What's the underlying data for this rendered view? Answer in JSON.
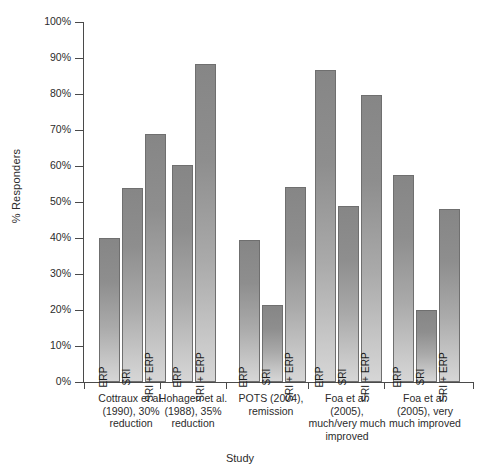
{
  "chart_data": {
    "type": "bar",
    "title": "",
    "xlabel": "Study",
    "ylabel": "% Responders",
    "ylim": [
      0,
      100
    ],
    "ytick_labels": [
      "100%",
      "90%",
      "80%",
      "70%",
      "60%",
      "50%",
      "40%",
      "30%",
      "20%",
      "10%",
      "0%"
    ],
    "ytick_values": [
      100,
      90,
      80,
      70,
      60,
      50,
      40,
      30,
      20,
      10,
      0
    ],
    "grid": false,
    "legend": "none",
    "series_names": [
      "ERP",
      "SRI",
      "SRI + ERP"
    ],
    "categories": [
      "Cottraux et al. (1990), 30% reduction",
      "Hohagen et al. (1988), 35% reduction",
      "POTS (2004), remission",
      "Foa et al. (2005), much/very much improved",
      "Foa et al. (2005), very much improved"
    ],
    "groups": [
      {
        "caption_lines": [
          "Cottraux et al.",
          "(1990), 30%",
          "reduction"
        ],
        "bars": [
          {
            "label": "ERP",
            "value": 40.0
          },
          {
            "label": "SRI",
            "value": 54.0
          },
          {
            "label": "SRI + ERP",
            "value": 69.0
          }
        ]
      },
      {
        "caption_lines": [
          "Hohagen et al.",
          "(1988), 35%",
          "reduction"
        ],
        "bars": [
          {
            "label": "ERP",
            "value": 60.3
          },
          {
            "label": "SRI + ERP",
            "value": 88.2
          }
        ]
      },
      {
        "caption_lines": [
          "POTS (2004),",
          "remission"
        ],
        "bars": [
          {
            "label": "ERP",
            "value": 39.5
          },
          {
            "label": "SRI",
            "value": 21.5
          },
          {
            "label": "SRI + ERP",
            "value": 54.2
          }
        ]
      },
      {
        "caption_lines": [
          "Foa et al.",
          "(2005),",
          "much/very much",
          "improved"
        ],
        "bars": [
          {
            "label": "ERP",
            "value": 86.6
          },
          {
            "label": "SRI",
            "value": 48.9
          },
          {
            "label": "SRI + ERP",
            "value": 79.7
          }
        ]
      },
      {
        "caption_lines": [
          "Foa et al.",
          "(2005), very",
          "much improved"
        ],
        "bars": [
          {
            "label": "ERP",
            "value": 57.5
          },
          {
            "label": "SRI",
            "value": 20.0
          },
          {
            "label": "SRI + ERP",
            "value": 48.0
          }
        ]
      }
    ]
  },
  "colors": {
    "bar_top": "#868686",
    "bar_bottom": "#d6d6d6",
    "bar_border": "#6f6f6f",
    "axis": "#4a4a4a",
    "text": "#2b2b2b",
    "background": "#ffffff"
  }
}
